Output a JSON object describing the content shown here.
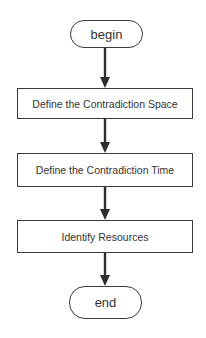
{
  "diagram": {
    "type": "flowchart",
    "direction": "top-to-bottom",
    "colors": {
      "stroke": "#3a3a3a",
      "text": "#333333",
      "background": "#ffffff"
    },
    "nodes": [
      {
        "id": "begin",
        "shape": "terminal",
        "label": "begin"
      },
      {
        "id": "step1",
        "shape": "process",
        "label": "Define the Contradiction Space"
      },
      {
        "id": "step2",
        "shape": "process",
        "label": "Define the Contradiction Time"
      },
      {
        "id": "step3",
        "shape": "process",
        "label": "Identify Resources"
      },
      {
        "id": "end",
        "shape": "terminal",
        "label": "end"
      }
    ],
    "edges": [
      {
        "from": "begin",
        "to": "step1"
      },
      {
        "from": "step1",
        "to": "step2"
      },
      {
        "from": "step2",
        "to": "step3"
      },
      {
        "from": "step3",
        "to": "end"
      }
    ]
  }
}
